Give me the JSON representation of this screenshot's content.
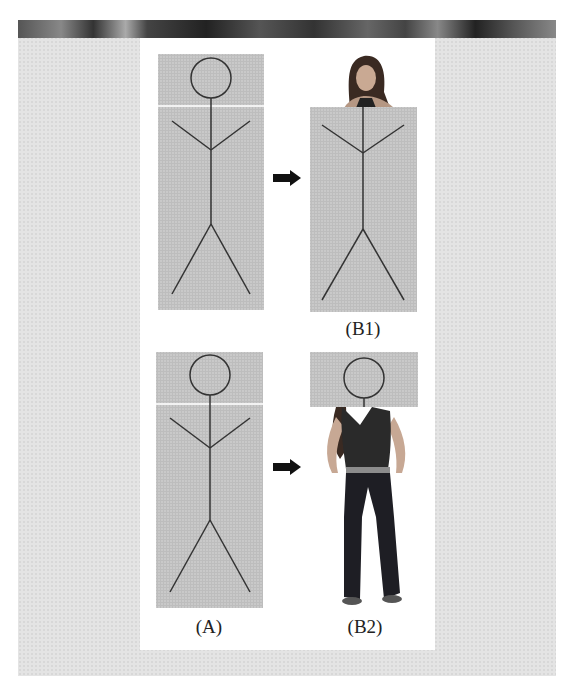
{
  "figure": {
    "panels": [
      {
        "id": "A-top",
        "label": null
      },
      {
        "id": "B1",
        "label": "(B1)"
      },
      {
        "id": "A-bottom",
        "label": "(A)"
      },
      {
        "id": "B2",
        "label": "(B2)"
      }
    ],
    "labels": {
      "a": "(A)",
      "b1": "(B1)",
      "b2": "(B2)"
    },
    "arrows": [
      {
        "from": "A-top",
        "to": "B1",
        "direction": "right"
      },
      {
        "from": "A-bottom",
        "to": "B2",
        "direction": "right"
      }
    ],
    "colors": {
      "outer_background": "#e4e4e4",
      "panel_background": "#ffffff",
      "box_fill": "#c9c9c9",
      "stroke": "#333333",
      "arrow": "#111111"
    }
  }
}
